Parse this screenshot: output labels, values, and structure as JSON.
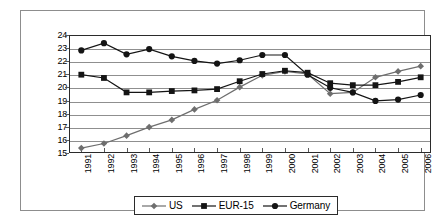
{
  "chart_data": {
    "type": "line",
    "title": "",
    "subtitle": "",
    "xlabel": "",
    "ylabel": "",
    "categories": [
      "1991",
      "1992",
      "1993",
      "1994",
      "1995",
      "1996",
      "1997",
      "1998",
      "1999",
      "2000",
      "2001",
      "2002",
      "2003",
      "2004",
      "2005",
      "2006"
    ],
    "ylim": [
      15,
      24
    ],
    "ytick_labels": [
      "24",
      "23",
      "22",
      "21",
      "20",
      "19",
      "18",
      "17",
      "16",
      "15"
    ],
    "yticks": [
      24,
      23,
      22,
      21,
      20,
      19,
      18,
      17,
      16,
      15
    ],
    "grid": true,
    "grid_axis": "y",
    "legend_position": "bottom",
    "series": [
      {
        "name": "US",
        "marker": "diamond",
        "color": "#6e6e6e",
        "line_color": "#6e6e6e",
        "values": [
          15.45,
          15.8,
          16.4,
          17.05,
          17.6,
          18.4,
          19.1,
          20.1,
          21.0,
          21.3,
          21.1,
          19.6,
          19.7,
          20.85,
          21.3,
          21.7
        ]
      },
      {
        "name": "EUR-15",
        "marker": "square",
        "color": "#141414",
        "line_color": "#141414",
        "values": [
          21.05,
          20.8,
          19.7,
          19.7,
          19.8,
          19.85,
          19.95,
          20.55,
          21.1,
          21.35,
          21.2,
          20.4,
          20.25,
          20.25,
          20.5,
          20.85
        ]
      },
      {
        "name": "Germany",
        "marker": "circle",
        "color": "#141414",
        "line_color": "#141414",
        "values": [
          22.9,
          23.45,
          22.6,
          23.0,
          22.45,
          22.1,
          21.9,
          22.15,
          22.55,
          22.55,
          21.05,
          20.05,
          19.7,
          19.05,
          19.15,
          19.5
        ]
      }
    ]
  },
  "legend": {
    "items": [
      {
        "label": "US",
        "marker": "diamond-marker-icon",
        "color": "#6e6e6e"
      },
      {
        "label": "EUR-15",
        "marker": "square-marker-icon",
        "color": "#141414"
      },
      {
        "label": "Germany",
        "marker": "circle-marker-icon",
        "color": "#141414"
      }
    ]
  },
  "colors": {
    "frame": "#8d8d8d",
    "axis": "#2b2b2b",
    "grid": "#8f8f8f",
    "background": "#ffffff"
  }
}
